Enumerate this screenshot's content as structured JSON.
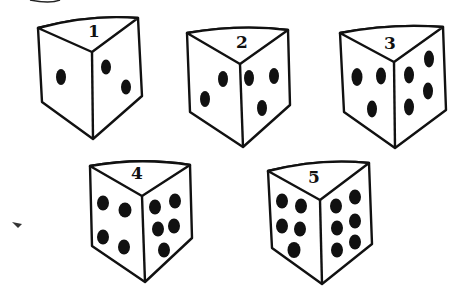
{
  "figure": {
    "colors": {
      "ink": "#111111",
      "background": "#ffffff"
    }
  },
  "dice": [
    {
      "label": "1",
      "left_face_pips": 1,
      "right_face_pips": 2
    },
    {
      "label": "2",
      "left_face_pips": 2,
      "right_face_pips": 3
    },
    {
      "label": "3",
      "left_face_pips": 3,
      "right_face_pips": 4
    },
    {
      "label": "4",
      "left_face_pips": 4,
      "right_face_pips": 5
    },
    {
      "label": "5",
      "left_face_pips": 5,
      "right_face_pips": 6
    }
  ]
}
